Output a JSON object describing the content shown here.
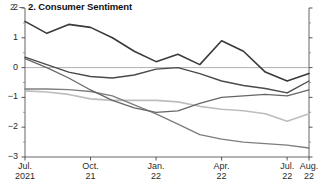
{
  "header": {
    "panel_number": "2",
    "dash": "–",
    "title": "2. Consumer Sentiment"
  },
  "chart_data": {
    "type": "line",
    "title": "2. Consumer Sentiment",
    "xlabel": "",
    "ylabel": "",
    "ylim": [
      -3,
      2
    ],
    "yticks": [
      2,
      1,
      0,
      -1,
      -2,
      -3
    ],
    "ytick_labels": [
      "2",
      "1",
      "0",
      "−1",
      "−2",
      "−3"
    ],
    "yminor_ticks": [
      1.5,
      0.5,
      -0.5,
      -1.5,
      -2.5
    ],
    "grid": false,
    "zero_line": true,
    "legend": "none",
    "right_axis_ticks": true,
    "x_tick_positions": [
      0,
      3,
      6,
      9,
      12,
      13
    ],
    "x_tick_labels": [
      {
        "l1": "Jul.",
        "l2": "2021"
      },
      {
        "l1": "Oct.",
        "l2": "21"
      },
      {
        "l1": "Jan.",
        "l2": "22"
      },
      {
        "l1": "Apr.",
        "l2": "22"
      },
      {
        "l1": "Jul.",
        "l2": "22"
      },
      {
        "l1": "Aug.",
        "l2": "22"
      }
    ],
    "x": [
      0,
      1,
      2,
      3,
      4,
      5,
      6,
      7,
      8,
      9,
      10,
      11,
      12,
      13
    ],
    "series": [
      {
        "name": "series-1",
        "color": "#3a3a3a",
        "width": 1.6,
        "values": [
          1.55,
          1.15,
          1.45,
          1.35,
          1.0,
          0.55,
          0.2,
          0.45,
          0.1,
          0.9,
          0.55,
          -0.15,
          -0.45,
          -0.2
        ]
      },
      {
        "name": "series-2",
        "color": "#4a4a4a",
        "width": 1.4,
        "values": [
          0.35,
          0.1,
          -0.15,
          -0.3,
          -0.35,
          -0.25,
          -0.05,
          0.0,
          -0.2,
          -0.45,
          -0.6,
          -0.7,
          -0.85,
          -0.45
        ]
      },
      {
        "name": "series-3",
        "color": "#666666",
        "width": 1.3,
        "values": [
          0.3,
          0.0,
          -0.35,
          -0.75,
          -1.1,
          -1.35,
          -1.5,
          -1.45,
          -1.2,
          -1.0,
          -0.95,
          -0.9,
          -0.95,
          -0.75
        ]
      },
      {
        "name": "series-4",
        "color": "#7d7d7d",
        "width": 1.4,
        "values": [
          -0.72,
          -0.72,
          -0.74,
          -0.8,
          -0.95,
          -1.25,
          -1.55,
          -1.9,
          -2.25,
          -2.4,
          -2.5,
          -2.55,
          -2.6,
          -2.7
        ]
      },
      {
        "name": "series-5",
        "color": "#bdbdbd",
        "width": 1.6,
        "values": [
          -0.78,
          -0.82,
          -0.9,
          -1.05,
          -1.1,
          -1.1,
          -1.1,
          -1.15,
          -1.3,
          -1.4,
          -1.45,
          -1.55,
          -1.8,
          -1.55
        ]
      }
    ]
  }
}
